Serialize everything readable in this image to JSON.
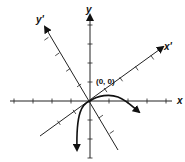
{
  "diagram": {
    "title": "",
    "axes": {
      "x_label": "x",
      "y_label": "y",
      "x_rotated_label": "x'",
      "y_rotated_label": "y'"
    },
    "origin_label": "(0, 0)",
    "rotation_angle_deg": 35,
    "tick_count_per_half_axis": 4,
    "curve": {
      "description": "Curve through the origin: descends steeply downward on the left (arrow pointing down), arcs over a small maximum to the right of the origin and ends with an arrow pointing down-right"
    }
  }
}
